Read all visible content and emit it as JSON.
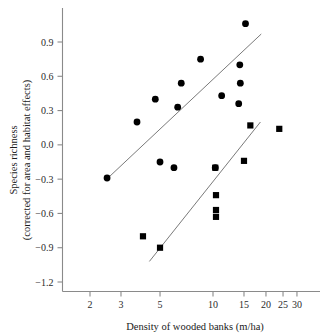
{
  "figure": {
    "background_color": "#ffffff",
    "marker_color": "#000000",
    "axis_color": "#8a8a8a",
    "fitline_color": "#7a7a7a"
  },
  "axes": {
    "y_title_line1": "Species richness",
    "y_title_line2": "(corrected for area and habitat effects)",
    "x_title": "Density of wooded banks (m/ha)",
    "y_ticks": [
      "0.9",
      "0.6",
      "0.3",
      "0.0",
      "−0.3",
      "−0.6",
      "−0.9",
      "−1.2"
    ],
    "x_ticks": [
      "2",
      "3",
      "5",
      "10",
      "15",
      "20",
      "25",
      "30"
    ]
  },
  "chart_data": {
    "type": "scatter",
    "title": "",
    "xlabel": "Density of wooded banks (m/ha)",
    "ylabel": "Species richness (corrected for area and habitat effects)",
    "xscale": "log",
    "yscale": "linear",
    "xlim": [
      1.75,
      32
    ],
    "ylim": [
      -1.3,
      1.15
    ],
    "xticks": [
      2,
      3,
      5,
      10,
      15,
      20,
      25,
      30
    ],
    "yticks": [
      0.9,
      0.6,
      0.3,
      0.0,
      -0.3,
      -0.6,
      -0.9,
      -1.2
    ],
    "grid": false,
    "legend": "none",
    "series": [
      {
        "name": "circles",
        "marker": "circle",
        "color": "#000000",
        "points": [
          [
            2.5,
            -0.29
          ],
          [
            3.7,
            0.2
          ],
          [
            4.7,
            0.4
          ],
          [
            5.0,
            -0.15
          ],
          [
            6.0,
            -0.2
          ],
          [
            6.3,
            0.33
          ],
          [
            6.6,
            0.54
          ],
          [
            8.5,
            0.75
          ],
          [
            10.3,
            -0.2
          ],
          [
            11.2,
            0.43
          ],
          [
            14.0,
            0.36
          ],
          [
            14.2,
            0.7
          ],
          [
            14.3,
            0.54
          ],
          [
            15.3,
            1.06
          ]
        ],
        "fit_line": {
          "x1": 2.45,
          "y1": -0.31,
          "x2": 18.8,
          "y2": 0.97
        }
      },
      {
        "name": "squares",
        "marker": "square",
        "color": "#000000",
        "points": [
          [
            4.0,
            -0.8
          ],
          [
            5.0,
            -0.9
          ],
          [
            10.3,
            -0.2
          ],
          [
            10.4,
            -0.44
          ],
          [
            10.4,
            -0.57
          ],
          [
            10.4,
            -0.63
          ],
          [
            15.0,
            -0.14
          ],
          [
            16.3,
            0.17
          ],
          [
            23.8,
            0.14
          ]
        ],
        "fit_line": {
          "x1": 4.35,
          "y1": -1.02,
          "x2": 18.6,
          "y2": 0.2
        }
      }
    ]
  }
}
